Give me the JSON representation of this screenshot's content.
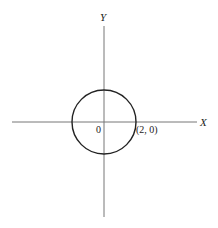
{
  "diagram": {
    "axes": {
      "x_label": "X",
      "y_label": "Y",
      "origin_label": "0"
    },
    "circle": {
      "center": [
        0,
        0
      ],
      "radius": 2,
      "point_label": "(2, 0)"
    },
    "colors": {
      "axis": "#777777",
      "circle": "#222222",
      "text": "#222222"
    }
  }
}
